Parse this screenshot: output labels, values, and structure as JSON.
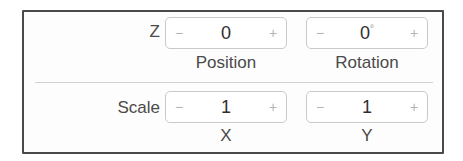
{
  "panel": {
    "rows": [
      {
        "label": "Z",
        "fields": [
          {
            "value": "0",
            "unit": "",
            "decrement": "−",
            "increment": "+",
            "caption": "Position"
          },
          {
            "value": "0",
            "unit": "°",
            "decrement": "−",
            "increment": "+",
            "caption": "Rotation"
          }
        ]
      },
      {
        "label": "Scale",
        "fields": [
          {
            "value": "1",
            "unit": "",
            "decrement": "−",
            "increment": "+",
            "caption": "X"
          },
          {
            "value": "1",
            "unit": "",
            "decrement": "−",
            "increment": "+",
            "caption": "Y"
          }
        ]
      }
    ]
  },
  "colors": {
    "panel_border": "#4a4a4a",
    "stepper_border": "#c9c9c9",
    "separator": "#d2d2d2",
    "text": "#4a4a4a",
    "button_glyph": "#b5b5b5"
  }
}
